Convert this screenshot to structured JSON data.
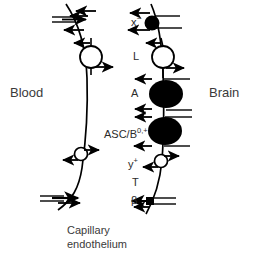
{
  "figure": {
    "type": "diagram",
    "background_color": "#ffffff",
    "ink_color": "#000000",
    "text_color": "#2b2b2b"
  },
  "side_labels": {
    "left": "Blood",
    "right": "Brain"
  },
  "caption": {
    "line1": "Capillary",
    "line2": "endothelium"
  },
  "transporter_labels": [
    {
      "id": "x-minus",
      "base": "x",
      "sup": "−",
      "display": "x−",
      "x": 131,
      "y": 18
    },
    {
      "id": "L",
      "base": "L",
      "sup": "",
      "display": "L",
      "x": 133,
      "y": 55
    },
    {
      "id": "A",
      "base": "A",
      "sup": "",
      "display": "A",
      "x": 131,
      "y": 92
    },
    {
      "id": "ASC-B0plus",
      "base": "ASC/B",
      "sup": "0,+",
      "display": "ASC/B0,+",
      "x": 104,
      "y": 131
    },
    {
      "id": "y-plus",
      "base": "y",
      "sup": "+",
      "display": "y+",
      "x": 128,
      "y": 160
    },
    {
      "id": "T",
      "base": "T",
      "sup": "",
      "display": "T",
      "x": 132,
      "y": 180
    },
    {
      "id": "beta",
      "base": "β",
      "sup": "",
      "display": "β",
      "x": 131,
      "y": 199
    }
  ],
  "membranes": [
    {
      "id": "luminal-membrane",
      "name": "luminal (blood-facing) membrane",
      "side": "left"
    },
    {
      "id": "abluminal-membrane",
      "name": "abluminal (brain-facing) membrane",
      "side": "right"
    }
  ],
  "symbols": {
    "open_circle": "open circle transporter",
    "filled_circle": "filled circle transporter",
    "filled_oval": "filled oval transporter",
    "arrow": "directional transport arrow"
  }
}
